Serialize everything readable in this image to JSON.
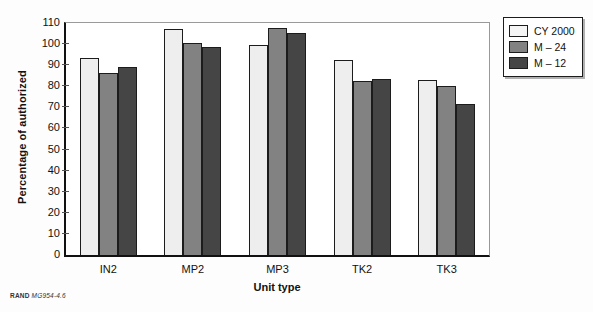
{
  "chart_data": {
    "type": "bar",
    "title": "",
    "xlabel": "Unit type",
    "ylabel": "Percentage of authorized",
    "categories": [
      "IN2",
      "MP2",
      "MP3",
      "TK2",
      "TK3"
    ],
    "series": [
      {
        "name": "CY 2000",
        "color": "#eeeeee",
        "values": [
          93.5,
          107.0,
          99.5,
          92.5,
          83.0
        ]
      },
      {
        "name": "M – 24",
        "color": "#828282",
        "values": [
          86.5,
          100.5,
          107.5,
          82.5,
          80.0
        ]
      },
      {
        "name": "M – 12",
        "color": "#454545",
        "values": [
          89.0,
          98.5,
          105.5,
          83.5,
          71.5
        ]
      }
    ],
    "ylim": [
      0,
      110
    ],
    "yticks": [
      0,
      10,
      20,
      30,
      40,
      50,
      60,
      70,
      80,
      90,
      100,
      110
    ],
    "grid": false,
    "legend_position": "right-top"
  },
  "footer": {
    "source": "RAND",
    "number": "MG954-4.6"
  }
}
